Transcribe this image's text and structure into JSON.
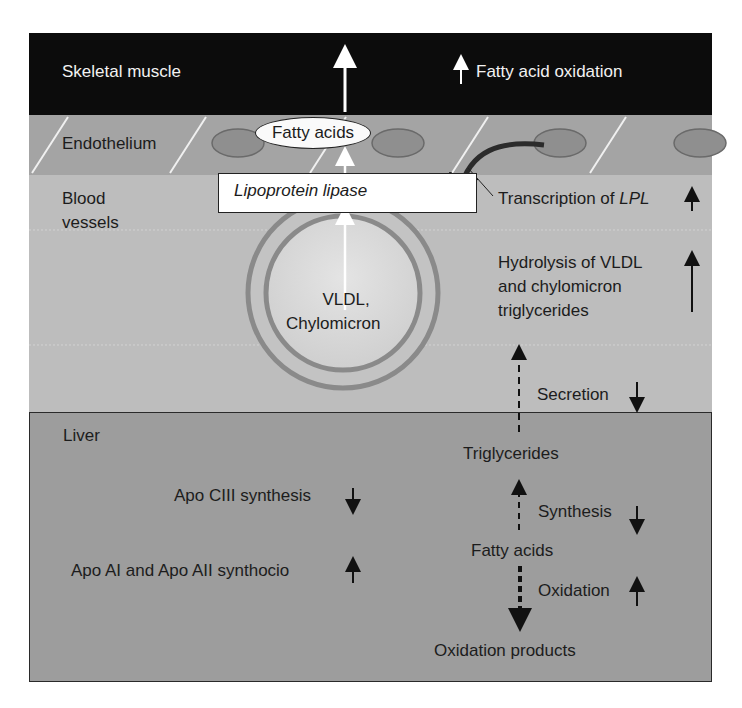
{
  "figure": {
    "regions": {
      "skeletal_muscle": "Skeletal muscle",
      "endothelium": "Endothelium",
      "blood_vessels_line1": "Blood",
      "blood_vessels_line2": "vessels",
      "liver": "Liver"
    },
    "muscle": {
      "effect_label": "Fatty acid oxidation",
      "effect_direction": "up"
    },
    "endothelium": {
      "fatty_acids_oval": "Fatty acids"
    },
    "blood": {
      "enzyme_box": "Lipoprotein lipase",
      "particle_line1": "VLDL,",
      "particle_line2": "Chylomicron",
      "transcription_prefix": "Transcription of ",
      "transcription_gene": "LPL",
      "transcription_direction": "up",
      "hydrolysis_line1": "Hydrolysis of VLDL",
      "hydrolysis_line2": "and chylomicron",
      "hydrolysis_line3": "triglycerides",
      "hydrolysis_direction": "up",
      "secretion_label": "Secretion",
      "secretion_direction": "down"
    },
    "liver": {
      "apo_c3_label": "Apo CIII synthesis",
      "apo_c3_direction": "down",
      "apo_a_label": "Apo AI and Apo AII synthocio",
      "apo_a_direction": "up",
      "triglycerides": "Triglycerides",
      "synthesis_label": "Synthesis",
      "synthesis_direction": "down",
      "fatty_acids": "Fatty acids",
      "oxidation_label": "Oxidation",
      "oxidation_direction": "up",
      "oxidation_products": "Oxidation products"
    },
    "colors": {
      "muscle": "#0c0c0c",
      "endothelium": "#a4a4a4",
      "blood": "#bdbdbd",
      "liver": "#9d9d9d",
      "nucleus": "#8f8f8f",
      "particle_ring": "#8a8a8a"
    }
  }
}
